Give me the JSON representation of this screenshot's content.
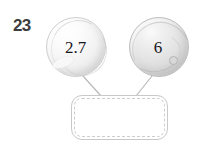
{
  "item": {
    "problem_number": "23",
    "type": "number-bond-diagram"
  },
  "parts": [
    {
      "id": "left",
      "label": "2.7",
      "shape": "ball-circle",
      "fill_color": "#f1f1f1",
      "stroke_color": "#cfcfcf"
    },
    {
      "id": "right",
      "label": "6",
      "shape": "ball-circle",
      "fill_color": "#e2e2e2",
      "stroke_color": "#bdbdbd"
    }
  ],
  "answer_box": {
    "value": "",
    "placeholder": "",
    "border_style": "solid-outer-dashed-inner",
    "border_color": "#c9c9c9",
    "dash_color": "#cdcdcd",
    "fill_color": "#ffffff"
  },
  "connectors": {
    "stroke_color": "#b9b9b9",
    "count": 2,
    "left_line": {
      "x1": 83,
      "y1": 76,
      "x2": 101,
      "y2": 96
    },
    "right_line": {
      "x1": 152,
      "y1": 76,
      "x2": 136,
      "y2": 96
    }
  },
  "colors": {
    "background": "#ffffff",
    "number_text": "#3d3d3d",
    "value_text": "#19191c"
  }
}
